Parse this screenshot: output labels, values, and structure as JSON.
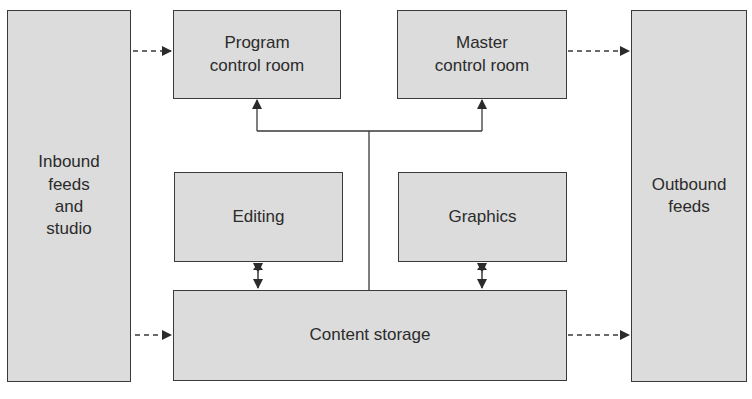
{
  "diagram": {
    "nodes": {
      "inbound": {
        "label": "Inbound\nfeeds\nand\nstudio"
      },
      "program_control": {
        "label": "Program\ncontrol room"
      },
      "master_control": {
        "label": "Master\ncontrol room"
      },
      "editing": {
        "label": "Editing"
      },
      "graphics": {
        "label": "Graphics"
      },
      "content_storage": {
        "label": "Content storage"
      },
      "outbound": {
        "label": "Outbound\nfeeds"
      }
    },
    "edges": [
      {
        "from": "inbound",
        "to": "program_control",
        "style": "dashed",
        "arrow": "end"
      },
      {
        "from": "inbound",
        "to": "content_storage",
        "style": "dashed",
        "arrow": "end"
      },
      {
        "from": "master_control",
        "to": "outbound",
        "style": "dashed",
        "arrow": "end"
      },
      {
        "from": "content_storage",
        "to": "outbound",
        "style": "dashed",
        "arrow": "end"
      },
      {
        "from": "editing",
        "to": "content_storage",
        "style": "solid",
        "arrow": "both"
      },
      {
        "from": "graphics",
        "to": "content_storage",
        "style": "solid",
        "arrow": "both"
      },
      {
        "from": "content_storage",
        "to": "program_control",
        "style": "solid",
        "arrow": "end"
      },
      {
        "from": "content_storage",
        "to": "master_control",
        "style": "solid",
        "arrow": "end"
      }
    ]
  },
  "colors": {
    "box_fill": "#dcdcdc",
    "stroke": "#3a3a3a",
    "text": "#2b2b2b",
    "background": "#ffffff"
  }
}
